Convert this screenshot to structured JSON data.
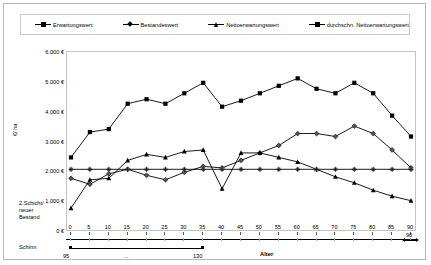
{
  "legend": {
    "items": [
      {
        "label": "Erwartungswert",
        "marker": "square"
      },
      {
        "label": "Bestandeswert",
        "marker": "diamond"
      },
      {
        "label": "Nettoerwartungswert",
        "marker": "triangle"
      },
      {
        "label": "durchschn. Nettoerwartungswert",
        "marker": "asterisk"
      }
    ]
  },
  "labels": {
    "y_axis_title": "€/ ha",
    "x_axis_title": "Alter",
    "left_block_line1": "2.Schicht/",
    "left_block_line2": "neuer",
    "left_block_line3": "Bestand",
    "schirm": "Schirm",
    "sec_start": "95",
    "sec_dots": "...",
    "sec_end": "130",
    "sec_right": "90"
  },
  "chart_data": {
    "type": "line",
    "title": "",
    "xlabel": "Alter",
    "ylabel": "€/ ha",
    "xlim": [
      0,
      90
    ],
    "ylim": [
      0,
      6000
    ],
    "ytick_labels": [
      "0 €",
      "1.000 €",
      "2.000 €",
      "3.000 €",
      "4.000 €",
      "5.000 €",
      "6.000 €"
    ],
    "ytick_values": [
      0,
      1000,
      2000,
      3000,
      4000,
      5000,
      6000
    ],
    "grid": false,
    "legend_position": "top",
    "x": [
      0,
      5,
      10,
      15,
      20,
      25,
      30,
      35,
      40,
      45,
      50,
      55,
      60,
      65,
      70,
      75,
      80,
      85,
      90
    ],
    "xtick_labels": [
      "0",
      "5",
      "10",
      "15",
      "20",
      "25",
      "30",
      "35",
      "40",
      "45",
      "50",
      "55",
      "60",
      "65",
      "70",
      "75",
      "80",
      "85",
      "90"
    ],
    "series": [
      {
        "name": "Erwartungswert",
        "marker": "square",
        "values": [
          2500,
          3350,
          3450,
          4300,
          4450,
          4300,
          4650,
          5000,
          4200,
          4400,
          4650,
          4900,
          5150,
          4800,
          4650,
          5000,
          4650,
          3900,
          3200
        ]
      },
      {
        "name": "Bestandeswert",
        "marker": "diamond",
        "values": [
          1800,
          1600,
          1950,
          2100,
          1900,
          1750,
          2000,
          2200,
          2150,
          2400,
          2650,
          2900,
          3300,
          3300,
          3200,
          3550,
          3300,
          2750,
          2150
        ]
      },
      {
        "name": "Nettoerwartungswert",
        "marker": "triangle",
        "values": [
          800,
          1750,
          1800,
          2400,
          2600,
          2500,
          2700,
          2750,
          1450,
          2650,
          2650,
          2500,
          2350,
          2100,
          1850,
          1650,
          1400,
          1200,
          1050
        ]
      },
      {
        "name": "durchschn. Nettoerwartungswert",
        "marker": "asterisk",
        "values": [
          2100,
          2100,
          2100,
          2100,
          2100,
          2100,
          2100,
          2100,
          2100,
          2100,
          2100,
          2100,
          2100,
          2100,
          2100,
          2100,
          2100,
          2100,
          2100
        ]
      }
    ]
  }
}
